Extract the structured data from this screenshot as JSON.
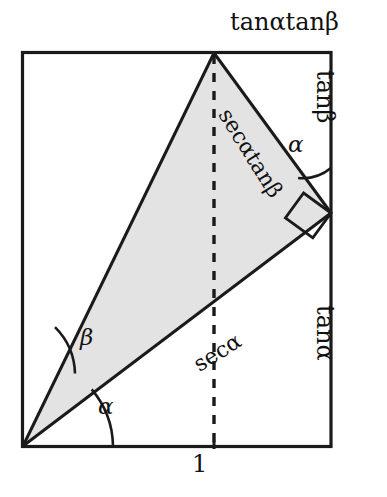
{
  "figure": {
    "background_color": "#ffffff",
    "stroke_color": "#1a1a1a",
    "shaded_fill_color": "#e3e3e3",
    "canvas": {
      "width": 387,
      "height": 497
    },
    "rectangle": {
      "left": 22,
      "top": 52,
      "right": 331,
      "bottom": 447
    },
    "points": {
      "origin": {
        "x": 23,
        "y": 446,
        "name": "bottom-left-vertex"
      },
      "apex": {
        "x": 214,
        "y": 53,
        "name": "top-apex"
      },
      "right_junction": {
        "x": 331,
        "y": 213,
        "name": "right-edge-junction"
      },
      "foot": {
        "x": 214,
        "y": 446,
        "name": "dashed-line-foot"
      }
    }
  },
  "labels": {
    "top_edge": "tanαtanβ",
    "right_upper_edge": "tanβ",
    "right_lower_edge": "tanα",
    "hypotenuse_upper": "secαtanβ",
    "hypotenuse_lower": "secα",
    "base_segment": "1",
    "angle_alpha_origin": "α",
    "angle_beta_origin": "β",
    "angle_alpha_right": "α"
  },
  "elements": {
    "shaded_triangle": "filled-gray-triangle",
    "dashed_altitude": "vertical-dashed-line",
    "right_angle_marker": "right-angle-square",
    "arc_alpha_origin": "angle-arc",
    "arc_beta_origin": "angle-arc",
    "arc_alpha_right": "angle-arc"
  }
}
